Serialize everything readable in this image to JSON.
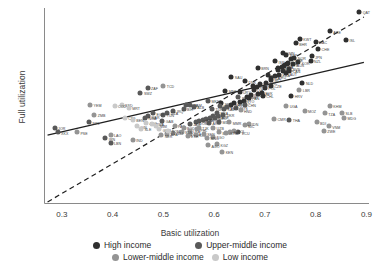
{
  "chart_data": {
    "type": "scatter",
    "title": "",
    "xlabel": "Basic utilization",
    "ylabel": "Full utilization",
    "xlim": [
      0.265,
      0.905
    ],
    "ylim": [
      0.265,
      0.925
    ],
    "xticks": [
      "0.3",
      "0.4",
      "0.5",
      "0.6",
      "0.7",
      "0.8",
      "0.9"
    ],
    "xtick_values": [
      0.3,
      0.4,
      0.5,
      0.6,
      0.7,
      0.8,
      0.9
    ],
    "yticks": [
      "0.3",
      "0.4",
      "0.5",
      "0.6",
      "0.7",
      "0.8",
      "0.9"
    ],
    "ytick_values": [
      0.3,
      0.4,
      0.5,
      0.6,
      0.7,
      0.8,
      0.9
    ],
    "grid": false,
    "legend_position": "bottom",
    "lines": [
      {
        "name": "regression-line",
        "style": "solid",
        "x": [
          0.272,
          0.895
        ],
        "y": [
          0.497,
          0.742
        ]
      },
      {
        "name": "identity-line",
        "style": "dashed",
        "x": [
          0.272,
          0.895
        ],
        "y": [
          0.272,
          0.895
        ]
      }
    ],
    "group_colors": {
      "High income": "#2f2f2f",
      "Upper-middle income": "#595959",
      "Lower-middle income": "#949494",
      "Low income": "#c9c9c9"
    },
    "series": [
      {
        "name": "High income",
        "color": "#2f2f2f",
        "points": [
          {
            "label": "QAT",
            "x": 0.886,
            "y": 0.912
          },
          {
            "label": "ARE",
            "x": 0.828,
            "y": 0.846
          },
          {
            "label": "ISL",
            "x": 0.86,
            "y": 0.818
          },
          {
            "label": "KWT",
            "x": 0.769,
            "y": 0.822
          },
          {
            "label": "MAC",
            "x": 0.8,
            "y": 0.812
          },
          {
            "label": "BHR",
            "x": 0.761,
            "y": 0.806
          },
          {
            "label": "CHE",
            "x": 0.805,
            "y": 0.786
          },
          {
            "label": "OMN",
            "x": 0.735,
            "y": 0.774
          },
          {
            "label": "JPN",
            "x": 0.792,
            "y": 0.762
          },
          {
            "label": "NZL",
            "x": 0.79,
            "y": 0.748
          },
          {
            "label": "KOR",
            "x": 0.766,
            "y": 0.742
          },
          {
            "label": "BRN",
            "x": 0.686,
            "y": 0.722
          },
          {
            "label": "SAU",
            "x": 0.634,
            "y": 0.692
          },
          {
            "label": "DNK",
            "x": 0.661,
            "y": 0.678
          },
          {
            "label": "NLD",
            "x": 0.774,
            "y": 0.672
          },
          {
            "label": "LUX",
            "x": 0.676,
            "y": 0.662
          },
          {
            "label": "MNE",
            "x": 0.622,
            "y": 0.646
          },
          {
            "label": "URY",
            "x": 0.65,
            "y": 0.642
          },
          {
            "label": "HRV",
            "x": 0.752,
            "y": 0.628
          },
          {
            "label": "SVN",
            "x": 0.748,
            "y": 0.72
          },
          {
            "label": "CYP",
            "x": 0.744,
            "y": 0.735
          },
          {
            "label": "ESP",
            "x": 0.735,
            "y": 0.712
          },
          {
            "label": "AUT",
            "x": 0.742,
            "y": 0.705
          },
          {
            "label": "FRA",
            "x": 0.728,
            "y": 0.7
          },
          {
            "label": "DEU",
            "x": 0.72,
            "y": 0.695
          },
          {
            "label": "ITA",
            "x": 0.712,
            "y": 0.69
          },
          {
            "label": "BEL",
            "x": 0.706,
            "y": 0.698
          },
          {
            "label": "SWE",
            "x": 0.752,
            "y": 0.752
          },
          {
            "label": "NOR",
            "x": 0.758,
            "y": 0.758
          },
          {
            "label": "FIN",
            "x": 0.745,
            "y": 0.74
          },
          {
            "label": "IRL",
            "x": 0.738,
            "y": 0.73
          },
          {
            "label": "PRT",
            "x": 0.726,
            "y": 0.722
          },
          {
            "label": "GRC",
            "x": 0.702,
            "y": 0.672
          },
          {
            "label": "CZE",
            "x": 0.712,
            "y": 0.664
          },
          {
            "label": "POL",
            "x": 0.7,
            "y": 0.655
          },
          {
            "label": "EST",
            "x": 0.69,
            "y": 0.668
          },
          {
            "label": "LTU",
            "x": 0.684,
            "y": 0.66
          },
          {
            "label": "LVA",
            "x": 0.678,
            "y": 0.648
          },
          {
            "label": "SVK",
            "x": 0.694,
            "y": 0.64
          },
          {
            "label": "HUN",
            "x": 0.686,
            "y": 0.636
          },
          {
            "label": "ISR",
            "x": 0.72,
            "y": 0.745
          },
          {
            "label": "SGP",
            "x": 0.742,
            "y": 0.768
          },
          {
            "label": "AUS",
            "x": 0.756,
            "y": 0.735
          },
          {
            "label": "CAN",
            "x": 0.748,
            "y": 0.712
          },
          {
            "label": "USA",
            "x": 0.734,
            "y": 0.726
          },
          {
            "label": "GBR",
            "x": 0.726,
            "y": 0.716
          },
          {
            "label": "CHL",
            "x": 0.696,
            "y": 0.628
          },
          {
            "label": "PAN",
            "x": 0.668,
            "y": 0.622
          },
          {
            "label": "TTO",
            "x": 0.658,
            "y": 0.612
          },
          {
            "label": "SYC",
            "x": 0.65,
            "y": 0.608
          },
          {
            "label": "BRB",
            "x": 0.64,
            "y": 0.604
          },
          {
            "label": "BHS",
            "x": 0.634,
            "y": 0.598
          },
          {
            "label": "MLT",
            "x": 0.712,
            "y": 0.682
          },
          {
            "label": "ROU",
            "x": 0.672,
            "y": 0.632
          },
          {
            "label": "BGR",
            "x": 0.664,
            "y": 0.626
          },
          {
            "label": "SRB",
            "x": 0.614,
            "y": 0.604
          }
        ]
      },
      {
        "name": "Upper-middle income",
        "color": "#595959",
        "points": [
          {
            "label": "ZAF",
            "x": 0.469,
            "y": 0.656
          },
          {
            "label": "SWZ",
            "x": 0.455,
            "y": 0.64
          },
          {
            "label": "BWA",
            "x": 0.544,
            "y": 0.6
          },
          {
            "label": "NAM",
            "x": 0.553,
            "y": 0.598
          },
          {
            "label": "MKD",
            "x": 0.588,
            "y": 0.612
          },
          {
            "label": "ALB",
            "x": 0.56,
            "y": 0.592
          },
          {
            "label": "BIH",
            "x": 0.54,
            "y": 0.584
          },
          {
            "label": "IRQ",
            "x": 0.52,
            "y": 0.578
          },
          {
            "label": "DZA",
            "x": 0.508,
            "y": 0.572
          },
          {
            "label": "TUN",
            "x": 0.5,
            "y": 0.566
          },
          {
            "label": "EGY",
            "x": 0.48,
            "y": 0.57
          },
          {
            "label": "MAR",
            "x": 0.47,
            "y": 0.56
          },
          {
            "label": "JOR",
            "x": 0.286,
            "y": 0.522
          },
          {
            "label": "XKX",
            "x": 0.292,
            "y": 0.506
          },
          {
            "label": "IRN",
            "x": 0.386,
            "y": 0.486
          },
          {
            "label": "LBN",
            "x": 0.396,
            "y": 0.47
          },
          {
            "label": "CHN",
            "x": 0.66,
            "y": 0.598
          },
          {
            "label": "THA",
            "x": 0.748,
            "y": 0.548
          },
          {
            "label": "MYS",
            "x": 0.644,
            "y": 0.588
          },
          {
            "label": "TUR",
            "x": 0.596,
            "y": 0.586
          },
          {
            "label": "RUS",
            "x": 0.612,
            "y": 0.594
          },
          {
            "label": "BRA",
            "x": 0.606,
            "y": 0.572
          },
          {
            "label": "MEX",
            "x": 0.598,
            "y": 0.562
          },
          {
            "label": "COL",
            "x": 0.592,
            "y": 0.556
          },
          {
            "label": "ARG",
            "x": 0.584,
            "y": 0.55
          },
          {
            "label": "PER",
            "x": 0.578,
            "y": 0.548
          },
          {
            "label": "CRI",
            "x": 0.57,
            "y": 0.544
          },
          {
            "label": "DOM",
            "x": 0.564,
            "y": 0.54
          },
          {
            "label": "JAM",
            "x": 0.552,
            "y": 0.536
          },
          {
            "label": "PRY",
            "x": 0.648,
            "y": 0.624
          },
          {
            "label": "GAB",
            "x": 0.498,
            "y": 0.544
          },
          {
            "label": "NGA",
            "x": 0.464,
            "y": 0.556
          },
          {
            "label": "KAZ",
            "x": 0.62,
            "y": 0.584
          },
          {
            "label": "AZE",
            "x": 0.608,
            "y": 0.56
          },
          {
            "label": "GEO",
            "x": 0.602,
            "y": 0.554
          },
          {
            "label": "ARM",
            "x": 0.59,
            "y": 0.538
          },
          {
            "label": "BLR",
            "x": 0.626,
            "y": 0.59
          },
          {
            "label": "UKR",
            "x": 0.618,
            "y": 0.566
          },
          {
            "label": "MDA",
            "x": 0.61,
            "y": 0.542
          },
          {
            "label": "ECU",
            "x": 0.648,
            "y": 0.506
          },
          {
            "label": "NPL",
            "x": 0.354,
            "y": 0.54
          }
        ]
      },
      {
        "name": "Lower-middle income",
        "color": "#949494",
        "points": [
          {
            "label": "TCD",
            "x": 0.5,
            "y": 0.664
          },
          {
            "label": "YEM",
            "x": 0.356,
            "y": 0.6
          },
          {
            "label": "ZMB",
            "x": 0.364,
            "y": 0.564
          },
          {
            "label": "PSE",
            "x": 0.33,
            "y": 0.506
          },
          {
            "label": "LAO",
            "x": 0.396,
            "y": 0.498
          },
          {
            "label": "IND",
            "x": 0.44,
            "y": 0.48
          },
          {
            "label": "PAK",
            "x": 0.522,
            "y": 0.528
          },
          {
            "label": "BGD",
            "x": 0.54,
            "y": 0.52
          },
          {
            "label": "LKA",
            "x": 0.552,
            "y": 0.512
          },
          {
            "label": "PHL",
            "x": 0.566,
            "y": 0.516
          },
          {
            "label": "IDN",
            "x": 0.668,
            "y": 0.536
          },
          {
            "label": "VNM",
            "x": 0.826,
            "y": 0.526
          },
          {
            "label": "KHM",
            "x": 0.828,
            "y": 0.596
          },
          {
            "label": "MMR",
            "x": 0.63,
            "y": 0.54
          },
          {
            "label": "UZB",
            "x": 0.598,
            "y": 0.52
          },
          {
            "label": "KGZ",
            "x": 0.606,
            "y": 0.466
          },
          {
            "label": "AGO",
            "x": 0.588,
            "y": 0.462
          },
          {
            "label": "KEN",
            "x": 0.616,
            "y": 0.44
          },
          {
            "label": "GHA",
            "x": 0.552,
            "y": 0.502
          },
          {
            "label": "CIV",
            "x": 0.564,
            "y": 0.498
          },
          {
            "label": "SEN",
            "x": 0.58,
            "y": 0.5
          },
          {
            "label": "CMR",
            "x": 0.718,
            "y": 0.552
          },
          {
            "label": "TGO",
            "x": 0.598,
            "y": 0.492
          },
          {
            "label": "BEN",
            "x": 0.61,
            "y": 0.506
          },
          {
            "label": "NIC",
            "x": 0.66,
            "y": 0.53
          },
          {
            "label": "HND",
            "x": 0.652,
            "y": 0.58
          },
          {
            "label": "BOL",
            "x": 0.64,
            "y": 0.512
          },
          {
            "label": "SLV",
            "x": 0.632,
            "y": 0.508
          },
          {
            "label": "GTM",
            "x": 0.624,
            "y": 0.504
          },
          {
            "label": "MNG",
            "x": 0.586,
            "y": 0.488
          },
          {
            "label": "TJK",
            "x": 0.57,
            "y": 0.52
          },
          {
            "label": "SDN",
            "x": 0.536,
            "y": 0.508
          },
          {
            "label": "ETH",
            "x": 0.548,
            "y": 0.494
          },
          {
            "label": "UGA",
            "x": 0.742,
            "y": 0.596
          },
          {
            "label": "MOZ",
            "x": 0.778,
            "y": 0.578
          },
          {
            "label": "TZA",
            "x": 0.818,
            "y": 0.57
          },
          {
            "label": "BDI",
            "x": 0.802,
            "y": 0.54
          },
          {
            "label": "ZWE",
            "x": 0.816,
            "y": 0.512
          },
          {
            "label": "SLB",
            "x": 0.852,
            "y": 0.572
          },
          {
            "label": "MDG",
            "x": 0.856,
            "y": 0.556
          },
          {
            "label": "LBR",
            "x": 0.768,
            "y": 0.648
          },
          {
            "label": "MLI",
            "x": 0.52,
            "y": 0.504
          },
          {
            "label": "BFA",
            "x": 0.508,
            "y": 0.5
          },
          {
            "label": "NER",
            "x": 0.496,
            "y": 0.496
          }
        ]
      },
      {
        "name": "Low income",
        "color": "#c9c9c9",
        "points": [
          {
            "label": "SSD",
            "x": 0.418,
            "y": 0.6
          },
          {
            "label": "MRT",
            "x": 0.432,
            "y": 0.588
          },
          {
            "label": "COD",
            "x": 0.404,
            "y": 0.594
          },
          {
            "label": "AFG",
            "x": 0.466,
            "y": 0.538
          },
          {
            "label": "GIN",
            "x": 0.448,
            "y": 0.526
          },
          {
            "label": "SLE",
            "x": 0.456,
            "y": 0.518
          },
          {
            "label": "RWA",
            "x": 0.478,
            "y": 0.534
          },
          {
            "label": "MWI",
            "x": 0.486,
            "y": 0.528
          },
          {
            "label": "GMB",
            "x": 0.492,
            "y": 0.516
          },
          {
            "label": "SOM",
            "x": 0.51,
            "y": 0.512
          },
          {
            "label": "CAF",
            "x": 0.424,
            "y": 0.556
          },
          {
            "label": "BEN2",
            "x": 0.44,
            "y": 0.548
          }
        ]
      }
    ]
  },
  "legend": {
    "row1": [
      {
        "label": "High income",
        "color": "#2f2f2f"
      },
      {
        "label": "Upper-middle income",
        "color": "#595959"
      }
    ],
    "row2": [
      {
        "label": "Lower-middle income",
        "color": "#949494"
      },
      {
        "label": "Low income",
        "color": "#c9c9c9"
      }
    ]
  }
}
